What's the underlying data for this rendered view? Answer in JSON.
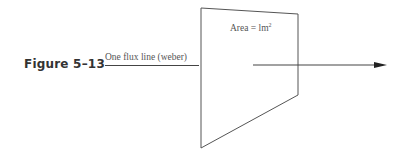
{
  "figure": {
    "label": "Figure 5–13",
    "flux_line_label": "One flux line (weber)",
    "area_label_prefix": "Area = lm",
    "area_label_exponent": "2",
    "colors": {
      "line": "#444444",
      "text": "#555555",
      "figure_label": "#333333"
    }
  }
}
